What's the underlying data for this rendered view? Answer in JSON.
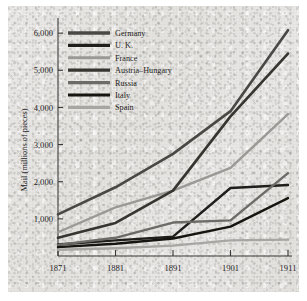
{
  "figure": {
    "name": "mail-volume-line-chart",
    "background_color": "#e7e6e4",
    "ink_color": "#25231f"
  },
  "chart_data": {
    "type": "line",
    "title": "",
    "subtitle": "",
    "xlabel": "",
    "ylabel": "Mail (millions of pieces)",
    "x": [
      1871,
      1881,
      1891,
      1901,
      1911
    ],
    "xtick_labels": [
      "1871",
      "1881",
      "1891",
      "1901",
      "1911"
    ],
    "xlim": [
      1871,
      1911
    ],
    "ytick_labels": [
      "1,000",
      "2,000",
      "3,000",
      "4,000",
      "5,000",
      "6,000"
    ],
    "yticks": [
      1000,
      2000,
      3000,
      4000,
      5000,
      6000
    ],
    "ylim": [
      0,
      6300
    ],
    "grid": false,
    "legend_position": "top-left",
    "series": [
      {
        "name": "Germany",
        "color": "#4a4845",
        "width": 2.6,
        "values": [
          1120,
          1850,
          2750,
          3900,
          6080
        ]
      },
      {
        "name": "U. K.",
        "color": "#201e1b",
        "width": 2.4,
        "values": [
          310,
          420,
          520,
          1830,
          1910
        ]
      },
      {
        "name": "France",
        "color": "#9b9995",
        "width": 2.4,
        "values": [
          640,
          1310,
          1760,
          2370,
          3820
        ]
      },
      {
        "name": "Austria–Hungary",
        "color": "#37352f",
        "width": 2.6,
        "values": [
          490,
          890,
          1760,
          3760,
          5450
        ]
      },
      {
        "name": "Russia",
        "color": "#6d6b67",
        "width": 2.4,
        "values": [
          300,
          490,
          900,
          960,
          2230
        ]
      },
      {
        "name": "Italy",
        "color": "#17150f",
        "width": 2.4,
        "values": [
          240,
          330,
          470,
          790,
          1560
        ]
      },
      {
        "name": "Spain",
        "color": "#a8a6a2",
        "width": 2.4,
        "values": [
          170,
          210,
          280,
          420,
          440
        ]
      }
    ]
  }
}
